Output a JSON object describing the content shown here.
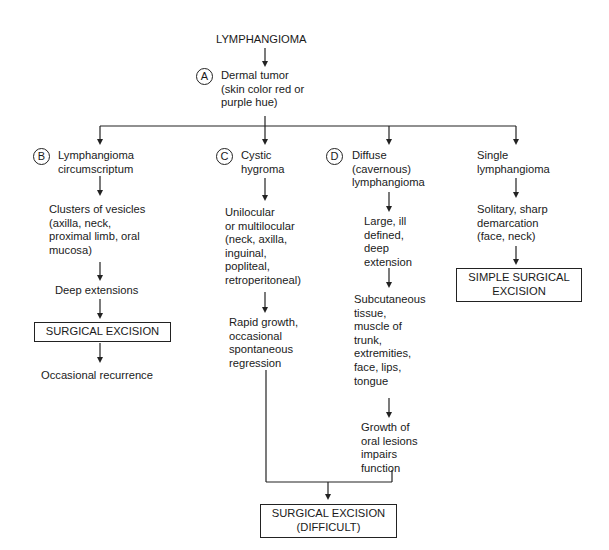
{
  "title": "LYMPHANGIOMA",
  "nodes": {
    "A": {
      "marker": "A",
      "text": "Dermal tumor\n(skin color red or\npurple hue)"
    },
    "B": {
      "marker": "B",
      "title": "Lymphangioma\ncircumscriptum",
      "steps": [
        "Clusters of vesicles\n(axilla, neck,\nproximal limb, oral\nmucosa)",
        "Deep extensions"
      ],
      "treatment": "SURGICAL EXCISION",
      "outcome": "Occasional recurrence"
    },
    "C": {
      "marker": "C",
      "title": "Cystic\nhygroma",
      "steps": [
        "Unilocular\nor multilocular\n(neck, axilla,\ninguinal,\npopliteal,\nretroperitoneal)",
        "Rapid growth,\noccasional\nspontaneous\nregression"
      ]
    },
    "D": {
      "marker": "D",
      "title": "Diffuse\n(cavernous)\nlymphangioma",
      "steps": [
        "Large, ill\ndefined,\ndeep\nextension",
        "Subcutaneous\ntissue,\nmuscle of\ntrunk,\nextremities,\nface, lips,\ntongue",
        "Growth of\noral lesions\nimpairs\nfunction"
      ]
    },
    "E": {
      "title": "Single\nlymphangioma",
      "steps": [
        "Solitary, sharp\ndemarcation\n(face, neck)"
      ],
      "treatment": "SIMPLE SURGICAL\nEXCISION"
    },
    "CD_treatment": "SURGICAL EXCISION\n(DIFFICULT)"
  }
}
